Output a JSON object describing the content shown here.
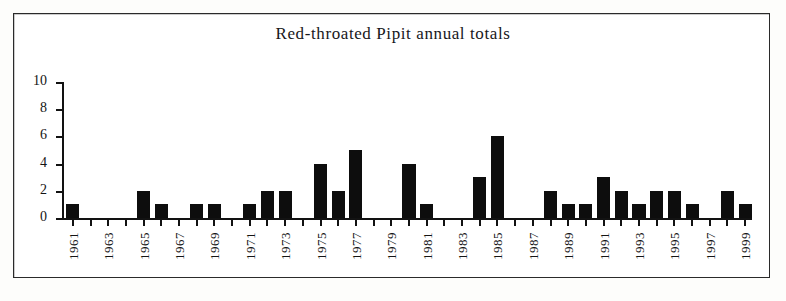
{
  "figure": {
    "background_color": "#fdfdfb",
    "frame_color": "#2a2a2a",
    "bar_color": "#0d0d0d",
    "axis_color": "#121212"
  },
  "chart_data": {
    "type": "bar",
    "title": "Red-throated Pipit annual totals",
    "xlabel": "",
    "ylabel": "",
    "ylim": [
      0,
      10
    ],
    "ytick_labels": [
      "0",
      "2",
      "4",
      "6",
      "8",
      "10"
    ],
    "ytick_values": [
      0,
      2,
      4,
      6,
      8,
      10
    ],
    "grid": false,
    "legend": null,
    "xtick_labels_shown": [
      "1961",
      "1963",
      "1965",
      "1967",
      "1969",
      "1971",
      "1973",
      "1975",
      "1977",
      "1979",
      "1981",
      "1983",
      "1985",
      "1987",
      "1989",
      "1991",
      "1993",
      "1995",
      "1997",
      "1999"
    ],
    "categories": [
      "1961",
      "1962",
      "1963",
      "1964",
      "1965",
      "1966",
      "1967",
      "1968",
      "1969",
      "1970",
      "1971",
      "1972",
      "1973",
      "1974",
      "1975",
      "1976",
      "1977",
      "1978",
      "1979",
      "1980",
      "1981",
      "1982",
      "1983",
      "1984",
      "1985",
      "1986",
      "1987",
      "1988",
      "1989",
      "1990",
      "1991",
      "1992",
      "1993",
      "1994",
      "1995",
      "1996",
      "1997",
      "1998",
      "1999"
    ],
    "values": [
      1,
      0,
      0,
      0,
      2,
      1,
      0,
      1,
      1,
      0,
      1,
      2,
      2,
      0,
      4,
      2,
      5,
      0,
      0,
      4,
      1,
      0,
      0,
      3,
      6,
      0,
      0,
      2,
      1,
      1,
      3,
      2,
      1,
      2,
      2,
      1,
      0,
      2,
      1
    ]
  }
}
